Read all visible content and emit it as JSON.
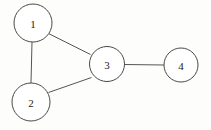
{
  "figure": {
    "title": "",
    "background_color": "#fdfdfb",
    "width": 211,
    "height": 130
  },
  "chart_data": {
    "type": "diagram",
    "diagram_kind": "undirected-node-link-graph",
    "title": "",
    "xlabel": "",
    "ylabel": "",
    "grid": false,
    "legend": null,
    "node_style": {
      "fill": "#ffffff",
      "stroke": "#4a4a4a",
      "stroke_width": 1
    },
    "edge_style": {
      "stroke": "#555555",
      "stroke_width": 1,
      "directed": false
    },
    "nodes": [
      {
        "id": "1",
        "label": "1",
        "cx": 33,
        "cy": 23,
        "r": 19
      },
      {
        "id": "2",
        "label": "2",
        "cx": 31,
        "cy": 102,
        "r": 19
      },
      {
        "id": "3",
        "label": "3",
        "cx": 107,
        "cy": 64,
        "r": 17.5
      },
      {
        "id": "4",
        "label": "4",
        "cx": 181,
        "cy": 65,
        "r": 17
      }
    ],
    "edges": [
      {
        "source": "1",
        "target": "2",
        "x1": 32,
        "y1": 42,
        "x2": 31,
        "y2": 83
      },
      {
        "source": "1",
        "target": "3",
        "x1": 48.5,
        "y1": 33.5,
        "x2": 90.5,
        "y2": 54.5
      },
      {
        "source": "2",
        "target": "3",
        "x1": 48.5,
        "y1": 92.5,
        "x2": 91.5,
        "y2": 77.5
      },
      {
        "source": "3",
        "target": "4",
        "x1": 124.5,
        "y1": 64.5,
        "x2": 164,
        "y2": 65
      }
    ]
  }
}
